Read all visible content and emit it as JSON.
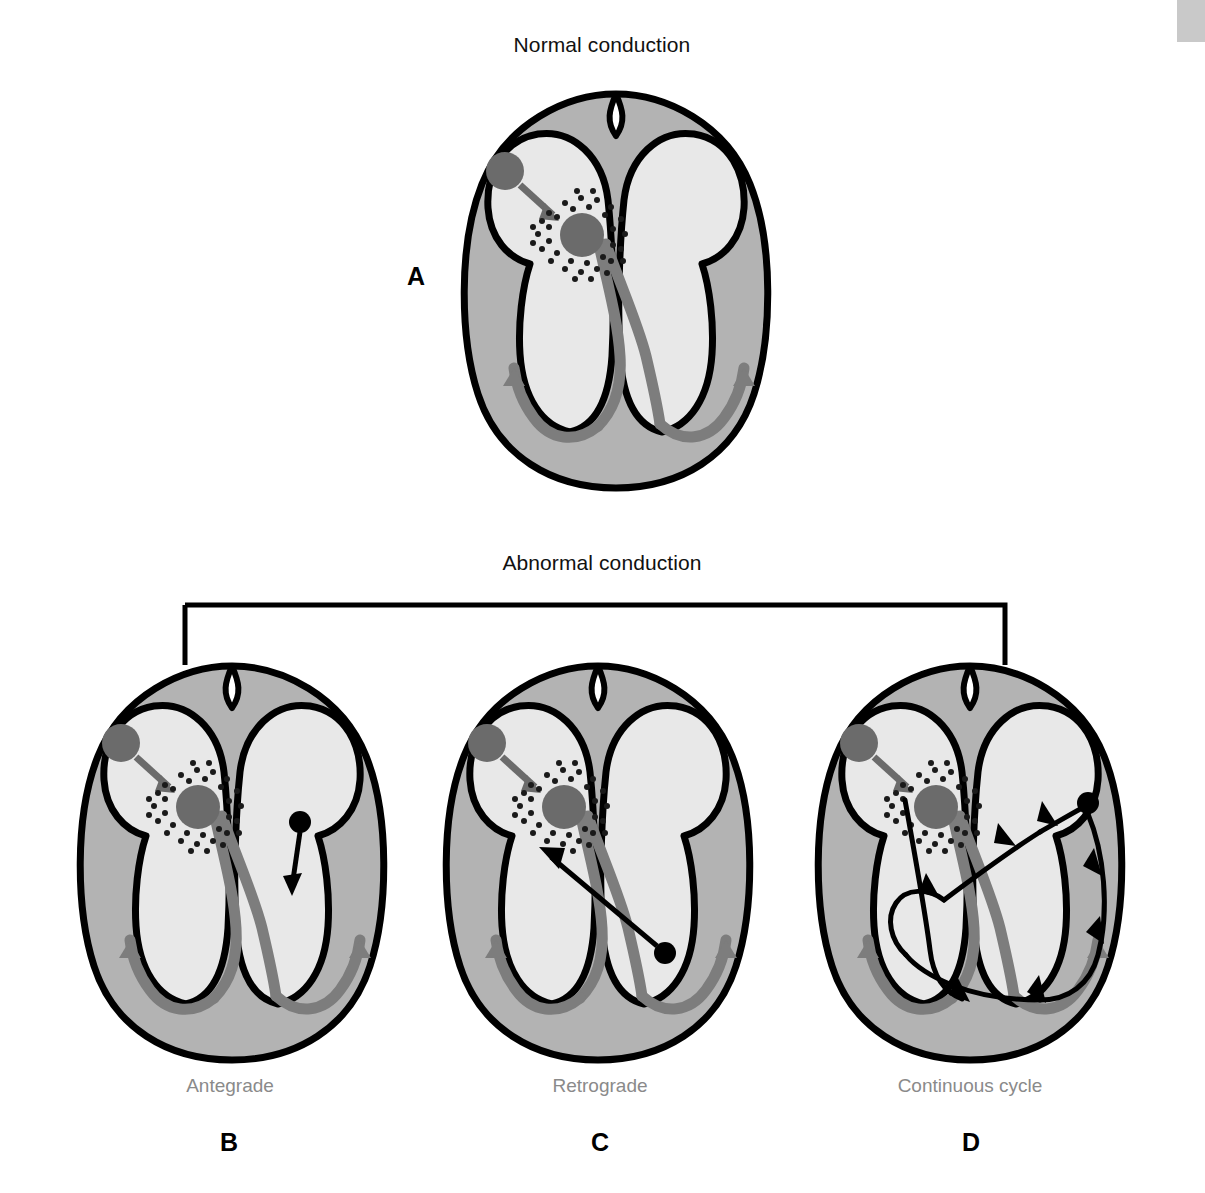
{
  "figure": {
    "sections": [
      {
        "id": "normal",
        "title": "Normal conduction"
      },
      {
        "id": "abnormal",
        "title": "Abnormal conduction"
      }
    ],
    "panels": [
      {
        "letter": "A",
        "sublabel": "",
        "description": "Normal conduction heart"
      },
      {
        "letter": "B",
        "sublabel": "Antegrade",
        "description": "Antegrade conduction heart"
      },
      {
        "letter": "C",
        "sublabel": "Retrograde",
        "description": "Retrograde conduction heart"
      },
      {
        "letter": "D",
        "sublabel": "Continuous cycle",
        "description": "Continuous cycle reentry heart"
      }
    ],
    "colors": {
      "outline": "#000000",
      "myocardium": "#b3b3b3",
      "chamber": "#e8e8e8",
      "node": "#6b6b6b",
      "conduction_band": "#7d7d7d",
      "ectopic": "#000000",
      "sublabel_text": "#8a8a8a",
      "title_text": "#111111",
      "corner_tab": "#c9c9c9",
      "page_background": "#ffffff"
    },
    "anatomy_legend": {
      "sa_node": "sinoatrial node",
      "av_node": "atrioventricular node",
      "bundle_branches": "bundle of His and bundle branches",
      "purkinje": "Purkinje fibers"
    }
  }
}
